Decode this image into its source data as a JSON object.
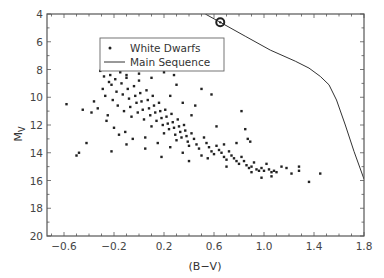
{
  "chart_data": {
    "type": "scatter",
    "title": "",
    "xlabel": "(B−V)",
    "ylabel": "M",
    "ylabel_subscript": "V",
    "xlim": [
      -0.736,
      1.8
    ],
    "ylim": [
      20,
      4
    ],
    "y_inverted": true,
    "grid": false,
    "x_ticks": [
      -0.6,
      -0.2,
      0.2,
      0.6,
      1.0,
      1.4,
      1.8
    ],
    "x_tick_labels": [
      "−0.6",
      "−0.2",
      "0.2",
      "0.6",
      "1.0",
      "1.4",
      "1.8"
    ],
    "y_ticks": [
      4,
      6,
      8,
      10,
      12,
      14,
      16,
      18,
      20
    ],
    "y_tick_labels": [
      "4",
      "6",
      "8",
      "10",
      "12",
      "14",
      "16",
      "18",
      "20"
    ],
    "legend": {
      "position": "upper-left-inside",
      "entries": [
        {
          "label": "White Dwarfs",
          "marker": "dot"
        },
        {
          "label": "Main Sequence",
          "marker": "line"
        }
      ]
    },
    "series": [
      {
        "name": "Main Sequence",
        "kind": "line",
        "points": [
          [
            0.53,
            4.0
          ],
          [
            0.65,
            4.6
          ],
          [
            0.85,
            5.6
          ],
          [
            1.05,
            6.6
          ],
          [
            1.25,
            7.4
          ],
          [
            1.36,
            7.9
          ],
          [
            1.45,
            8.5
          ],
          [
            1.52,
            9.1
          ],
          [
            1.58,
            10.2
          ],
          [
            1.65,
            12.0
          ],
          [
            1.72,
            13.9
          ],
          [
            1.8,
            15.9
          ]
        ]
      },
      {
        "name": "Sun marker",
        "kind": "circle-dot",
        "points": [
          [
            0.65,
            4.6
          ]
        ]
      },
      {
        "name": "White Dwarfs",
        "kind": "scatter",
        "points": [
          [
            -0.58,
            10.5
          ],
          [
            -0.5,
            14.2
          ],
          [
            -0.48,
            14.0
          ],
          [
            -0.42,
            13.3
          ],
          [
            -0.45,
            10.9
          ],
          [
            -0.38,
            11.1
          ],
          [
            -0.36,
            10.3
          ],
          [
            -0.33,
            10.8
          ],
          [
            -0.31,
            8.1
          ],
          [
            -0.29,
            9.4
          ],
          [
            -0.28,
            8.5
          ],
          [
            -0.27,
            9.9
          ],
          [
            -0.26,
            11.7
          ],
          [
            -0.25,
            11.3
          ],
          [
            -0.24,
            8.9
          ],
          [
            -0.23,
            8.4
          ],
          [
            -0.22,
            9.1
          ],
          [
            -0.21,
            10.2
          ],
          [
            -0.2,
            12.2
          ],
          [
            -0.19,
            8.7
          ],
          [
            -0.18,
            9.6
          ],
          [
            -0.17,
            10.6
          ],
          [
            -0.16,
            12.7
          ],
          [
            -0.15,
            8.2
          ],
          [
            -0.14,
            9.0
          ],
          [
            -0.13,
            9.8
          ],
          [
            -0.12,
            11.0
          ],
          [
            -0.11,
            12.5
          ],
          [
            -0.1,
            8.6
          ],
          [
            -0.09,
            9.4
          ],
          [
            -0.08,
            10.1
          ],
          [
            -0.07,
            10.7
          ],
          [
            -0.06,
            11.4
          ],
          [
            -0.05,
            13.0
          ],
          [
            -0.04,
            9.2
          ],
          [
            -0.03,
            9.9
          ],
          [
            -0.02,
            10.4
          ],
          [
            -0.01,
            11.1
          ],
          [
            0.0,
            8.8
          ],
          [
            0.01,
            9.7
          ],
          [
            0.02,
            10.3
          ],
          [
            0.03,
            10.9
          ],
          [
            0.04,
            11.6
          ],
          [
            0.05,
            12.9
          ],
          [
            0.06,
            9.5
          ],
          [
            0.07,
            10.2
          ],
          [
            0.08,
            10.8
          ],
          [
            0.09,
            11.3
          ],
          [
            0.1,
            12.1
          ],
          [
            0.11,
            9.9
          ],
          [
            0.12,
            10.6
          ],
          [
            0.13,
            11.1
          ],
          [
            0.14,
            11.7
          ],
          [
            0.15,
            13.3
          ],
          [
            0.16,
            10.4
          ],
          [
            0.17,
            11.0
          ],
          [
            0.18,
            11.5
          ],
          [
            0.19,
            12.0
          ],
          [
            0.2,
            12.6
          ],
          [
            0.21,
            10.9
          ],
          [
            0.22,
            11.4
          ],
          [
            0.23,
            11.9
          ],
          [
            0.24,
            12.3
          ],
          [
            0.25,
            13.6
          ],
          [
            0.26,
            11.2
          ],
          [
            0.27,
            11.8
          ],
          [
            0.28,
            12.2
          ],
          [
            0.29,
            12.7
          ],
          [
            0.3,
            13.1
          ],
          [
            0.31,
            11.6
          ],
          [
            0.32,
            12.1
          ],
          [
            0.33,
            12.5
          ],
          [
            0.34,
            12.9
          ],
          [
            0.35,
            14.0
          ],
          [
            0.36,
            12.0
          ],
          [
            0.37,
            12.4
          ],
          [
            0.38,
            12.8
          ],
          [
            0.39,
            13.2
          ],
          [
            0.4,
            13.5
          ],
          [
            0.42,
            12.6
          ],
          [
            0.44,
            13.0
          ],
          [
            0.46,
            13.4
          ],
          [
            0.48,
            13.7
          ],
          [
            0.5,
            14.2
          ],
          [
            0.52,
            12.9
          ],
          [
            0.54,
            13.3
          ],
          [
            0.56,
            13.6
          ],
          [
            0.58,
            13.9
          ],
          [
            0.6,
            14.1
          ],
          [
            0.62,
            13.5
          ],
          [
            0.64,
            13.8
          ],
          [
            0.66,
            14.0
          ],
          [
            0.68,
            14.3
          ],
          [
            0.7,
            14.5
          ],
          [
            0.72,
            13.9
          ],
          [
            0.74,
            14.2
          ],
          [
            0.76,
            14.4
          ],
          [
            0.78,
            14.6
          ],
          [
            0.8,
            14.8
          ],
          [
            0.82,
            14.3
          ],
          [
            0.84,
            14.6
          ],
          [
            0.86,
            14.9
          ],
          [
            0.88,
            15.1
          ],
          [
            0.9,
            15.0
          ],
          [
            0.92,
            14.7
          ],
          [
            0.94,
            15.2
          ],
          [
            0.96,
            15.3
          ],
          [
            0.98,
            15.1
          ],
          [
            1.0,
            15.3
          ],
          [
            1.02,
            14.8
          ],
          [
            1.04,
            15.2
          ],
          [
            1.06,
            15.4
          ],
          [
            1.08,
            15.3
          ],
          [
            1.1,
            15.4
          ],
          [
            1.14,
            15.0
          ],
          [
            1.18,
            15.1
          ],
          [
            1.22,
            15.5
          ],
          [
            1.28,
            15.0
          ],
          [
            1.28,
            15.3
          ],
          [
            1.45,
            15.5
          ],
          [
            1.36,
            16.1
          ],
          [
            0.85,
            12.3
          ],
          [
            0.82,
            11.0
          ],
          [
            0.89,
            13.2
          ],
          [
            0.87,
            13.0
          ],
          [
            0.62,
            12.1
          ],
          [
            0.58,
            9.8
          ],
          [
            0.45,
            10.6
          ],
          [
            0.5,
            9.4
          ],
          [
            0.3,
            9.1
          ],
          [
            0.28,
            8.4
          ],
          [
            0.2,
            8.2
          ],
          [
            0.1,
            8.6
          ],
          [
            0.0,
            8.3
          ],
          [
            -0.1,
            8.4
          ],
          [
            0.25,
            9.9
          ],
          [
            0.35,
            10.4
          ],
          [
            0.42,
            11.3
          ],
          [
            -0.22,
            13.9
          ],
          [
            -0.1,
            13.4
          ],
          [
            0.05,
            13.7
          ],
          [
            0.18,
            14.3
          ],
          [
            0.4,
            14.6
          ],
          [
            0.55,
            14.4
          ],
          [
            0.7,
            15.0
          ],
          [
            0.9,
            15.4
          ],
          [
            1.06,
            15.7
          ],
          [
            0.98,
            15.8
          ],
          [
            0.78,
            13.3
          ],
          [
            0.68,
            13.4
          ]
        ]
      }
    ]
  }
}
